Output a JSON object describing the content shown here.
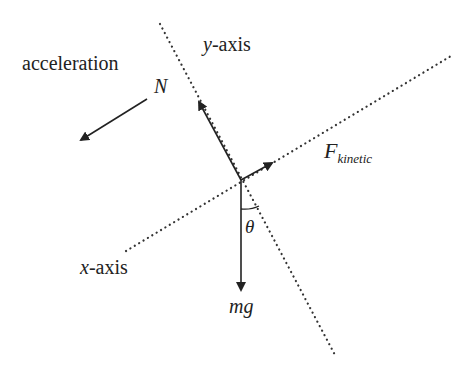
{
  "diagram": {
    "type": "free-body-diagram",
    "labels": {
      "acceleration": "acceleration",
      "normal_force": "N",
      "y_axis_var": "y",
      "y_axis_suffix": "-axis",
      "x_axis_var": "x",
      "x_axis_suffix": "-axis",
      "friction_main": "F",
      "friction_sub": "kinetic",
      "angle": "θ",
      "weight": "mg"
    },
    "colors": {
      "ink": "#222222",
      "background": "#ffffff"
    },
    "geometry": {
      "origin": [
        241,
        180
      ],
      "y_axis_line": [
        [
          160,
          24
        ],
        [
          335,
          355
        ]
      ],
      "x_axis_line": [
        [
          126,
          251
        ],
        [
          451,
          56
        ]
      ],
      "normal_arrow_tip": [
        199,
        102
      ],
      "friction_arrow_tip": [
        272,
        163
      ],
      "weight_arrow_tip": [
        241,
        290
      ],
      "acceleration_arrow": [
        [
          147,
          99
        ],
        [
          81,
          140
        ]
      ]
    }
  }
}
